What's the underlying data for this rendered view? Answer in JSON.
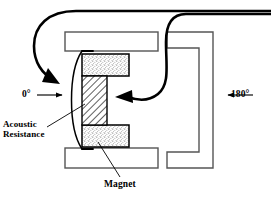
{
  "figure": {
    "kind": "cross-section-diagram",
    "background_color": "#ffffff",
    "line_color": "#000000",
    "structure_stroke_color": "#555555",
    "hatch_color": "#000000",
    "stipple_color": "#5a5a5a"
  },
  "labels": {
    "angle_front": "0°",
    "angle_rear": "180°",
    "acoustic_resistance_line1": "Acoustic",
    "acoustic_resistance_line2": "Resistance",
    "magnet": "Magnet"
  },
  "parts": {
    "top_plate": "top-pole-plate",
    "bottom_plate": "bottom-pole-plate",
    "upper_magnet": "upper-magnet-block",
    "lower_magnet": "lower-magnet-block",
    "diaphragm": "hatched-diaphragm-core",
    "acoustic_resistance_arc": "acoustic-resistance-screen",
    "rear_housing": "rear-c-bracket-housing"
  },
  "flow": {
    "front_arrow": "0-degree-sound-entry-arrow",
    "rear_arrow": "180-degree-sound-entry-arrow",
    "front_path": "front-sound-path-curve",
    "rear_path": "rear-sound-path-curve"
  },
  "leaders": {
    "acoustic_leader": "acoustic-resistance-leader-line",
    "magnet_leader": "magnet-leader-line"
  }
}
